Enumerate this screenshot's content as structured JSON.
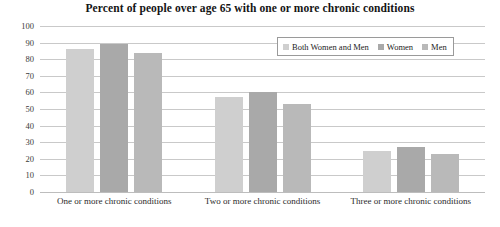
{
  "chart_data": {
    "type": "bar",
    "title": "Percent of people over age 65 with one or more chronic conditions",
    "xlabel": "",
    "ylabel": "",
    "ylim": [
      0,
      100
    ],
    "ytick_step": 10,
    "grid": true,
    "legend_position": "top-right",
    "categories": [
      "One or more chronic conditions",
      "Two or more chronic conditions",
      "Three or more chronic conditions"
    ],
    "ytick_labels": [
      "100",
      "90",
      "80",
      "70",
      "60",
      "50",
      "40",
      "30",
      "20",
      "10",
      "0"
    ],
    "series": [
      {
        "name": "Both Women and Men",
        "color": "#cfcfcf",
        "values": [
          86,
          57,
          25
        ]
      },
      {
        "name": "Women",
        "color": "#a9a9a9",
        "values": [
          89,
          60,
          27
        ]
      },
      {
        "name": "Men",
        "color": "#b9b9b9",
        "values": [
          84,
          53,
          23
        ]
      }
    ]
  }
}
